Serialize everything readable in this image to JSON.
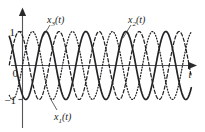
{
  "figure": {
    "name": "three-phase-sinusoid-plot",
    "background": "#ffffff",
    "ink_color": "#232326",
    "axis_color": "#55565a"
  },
  "axes": {
    "y_axis_name": "vertical-axis",
    "x_axis_name": "horizontal-time-axis",
    "x_label": "t",
    "y_ticks": [
      {
        "value": 1,
        "label": "1"
      },
      {
        "value": 0,
        "label": "0"
      },
      {
        "value": -1,
        "label": "−1"
      }
    ],
    "x_range": [
      -0.35,
      4.35
    ],
    "y_range": [
      -1.35,
      1.35
    ],
    "grid": false
  },
  "labels": {
    "x3": {
      "base": "x",
      "sub": "3",
      "args": "(t)"
    },
    "x2": {
      "base": "x",
      "sub": "2",
      "args": "(t)"
    },
    "x1": {
      "base": "x",
      "sub": "1",
      "args": "(t)"
    },
    "x3_text": "x3(t)",
    "x2_text": "x2(t)",
    "x1_text": "x1(t)"
  },
  "chart_data": {
    "type": "line",
    "title": "",
    "xlabel": "t",
    "ylabel": "",
    "xlim": [
      -0.35,
      4.35
    ],
    "ylim": [
      -1.35,
      1.35
    ],
    "grid": false,
    "legend_position": "inline-annotations",
    "x_tick_labels": [],
    "y_tick_labels": [
      "1",
      "0",
      "−1"
    ],
    "y_tick_values": [
      1,
      0,
      -1
    ],
    "amplitude": 1,
    "periods_shown": 4,
    "series": [
      {
        "name": "x1(t)",
        "style": "solid",
        "amplitude": 1,
        "frequency_cycles_per_unit": 1,
        "phase_deg": -120,
        "label_position": "below-axis-left",
        "description": "solid sinusoid lagging by 120 degrees"
      },
      {
        "name": "x2(t)",
        "style": "dashed",
        "amplitude": 1,
        "frequency_cycles_per_unit": 1,
        "phase_deg": -240,
        "label_position": "above-axis-right",
        "description": "dashed sinusoid lagging by 240 degrees"
      },
      {
        "name": "x3(t)",
        "style": "dotted",
        "amplitude": 1,
        "frequency_cycles_per_unit": 1,
        "phase_deg": 0,
        "label_position": "above-axis-left",
        "description": "dotted sinusoid at zero phase reference"
      }
    ]
  }
}
